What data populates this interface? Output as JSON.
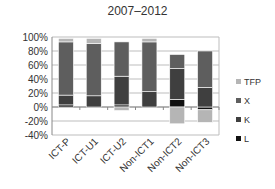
{
  "chart_data": {
    "type": "bar",
    "stacked": true,
    "title": "2007–2012",
    "xlabel": "",
    "ylabel": "",
    "ylim": [
      -40,
      100
    ],
    "yticks": [
      "100%",
      "80%",
      "60%",
      "40%",
      "20%",
      "0%",
      "-20%",
      "-40%"
    ],
    "categories": [
      "ICT-P",
      "ICT-U1",
      "ICT-U2",
      "Non-ICT1",
      "Non-ICT2",
      "Non-ICT3"
    ],
    "series": [
      {
        "name": "L",
        "color": "#111111",
        "values": [
          3,
          0,
          3,
          0,
          11,
          -4
        ]
      },
      {
        "name": "K",
        "color": "#3f3f3f",
        "values": [
          14,
          16,
          41,
          22,
          44,
          28
        ]
      },
      {
        "name": "X",
        "color": "#5e5e5e",
        "values": [
          76,
          75,
          49,
          71,
          20,
          52
        ]
      },
      {
        "name": "TFP",
        "color": "#b5b5b5",
        "values": [
          5,
          7,
          -5,
          5,
          -24,
          -18
        ]
      }
    ],
    "legend": [
      "TFP",
      "X",
      "K",
      "L"
    ],
    "legend_position": "right",
    "grid": true
  }
}
